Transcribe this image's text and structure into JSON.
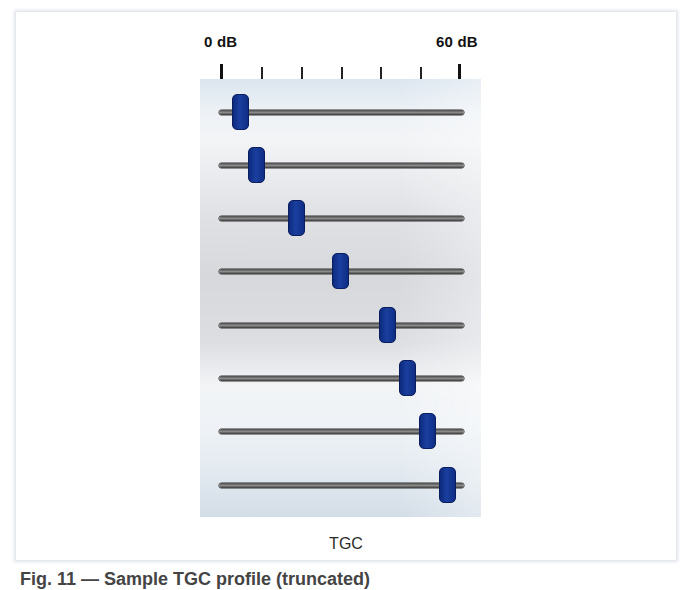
{
  "diagram": {
    "title": "TGC",
    "scale": {
      "min_label": "0 dB",
      "max_label": "60 dB",
      "min_db": 0,
      "max_db": 60,
      "tick_count": 7,
      "tick_step_db": 10
    },
    "colors": {
      "knob": "#123594",
      "track": "#5a5a5a",
      "panel_top": "#dbe5ef",
      "panel_mid": "#d6d8dc",
      "label": "#111111"
    },
    "sliders": [
      {
        "index": 1,
        "gain_db": 5
      },
      {
        "index": 2,
        "gain_db": 9
      },
      {
        "index": 3,
        "gain_db": 19
      },
      {
        "index": 4,
        "gain_db": 30
      },
      {
        "index": 5,
        "gain_db": 42
      },
      {
        "index": 6,
        "gain_db": 47
      },
      {
        "index": 7,
        "gain_db": 52
      },
      {
        "index": 8,
        "gain_db": 57
      }
    ],
    "figure_caption": "Fig. 11 — Sample TGC profile (truncated)"
  }
}
